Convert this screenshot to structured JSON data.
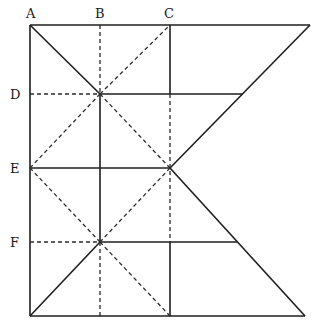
{
  "diagram": {
    "type": "geometric folding/construction diagram",
    "labels": {
      "A": "A",
      "B": "B",
      "C": "C",
      "D": "D",
      "E": "E",
      "F": "F"
    },
    "points": {
      "A": [
        30,
        25
      ],
      "top_right": [
        310,
        25
      ],
      "bottom_left": [
        30,
        316
      ],
      "bottom_right": [
        305,
        316
      ],
      "B_x": 100,
      "C_x": 170,
      "D_y": 94,
      "E_y": 168,
      "F_y": 242
    },
    "line_styles": {
      "solid_color": "#1e1e1e",
      "dashed_color": "#2a2a2a"
    }
  }
}
